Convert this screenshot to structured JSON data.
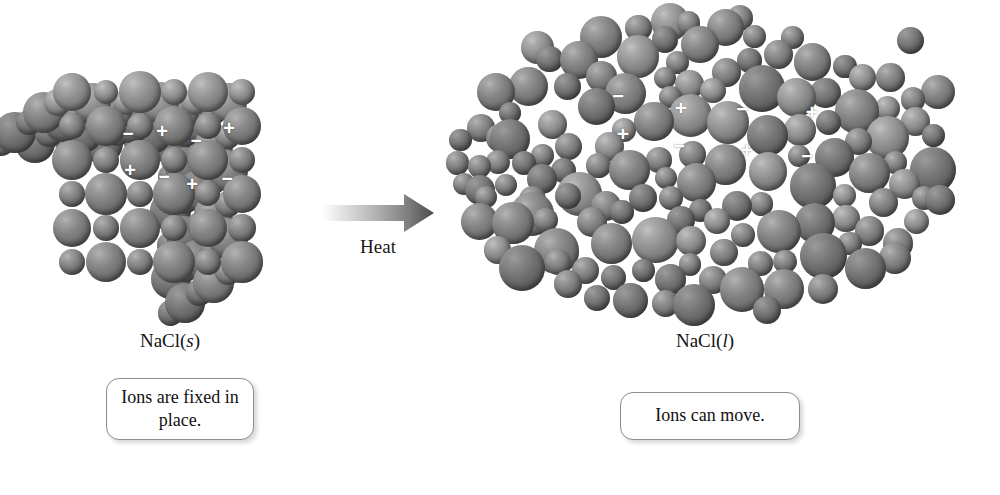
{
  "figure": {
    "type": "diagram",
    "topic": "Melting of sodium chloride: ionic solid to ionic liquid",
    "background_color": "#ffffff",
    "sphere_color": "#7a7a7a",
    "charge_label_color": "#ffffff"
  },
  "solid": {
    "state_label_main": "NaCl(",
    "state_label_italic": "s",
    "state_label_close": ")",
    "caption": "Ions are fixed in place.",
    "description": "Ordered cubic crystal lattice of alternating positive and negative ions",
    "charges": [
      {
        "sign": "−",
        "x": 128,
        "y": 133,
        "size": 19
      },
      {
        "sign": "+",
        "x": 162,
        "y": 131,
        "size": 20
      },
      {
        "sign": "−",
        "x": 196,
        "y": 140,
        "size": 19
      },
      {
        "sign": "+",
        "x": 229,
        "y": 128,
        "size": 20
      },
      {
        "sign": "+",
        "x": 130,
        "y": 170,
        "size": 20
      },
      {
        "sign": "−",
        "x": 164,
        "y": 176,
        "size": 19
      },
      {
        "sign": "+",
        "x": 192,
        "y": 184,
        "size": 20
      },
      {
        "sign": "−",
        "x": 227,
        "y": 178,
        "size": 19
      }
    ]
  },
  "arrow": {
    "label": "Heat",
    "gradient_from": "#ffffff",
    "gradient_to": "#4a4a4a",
    "direction": "left-to-right"
  },
  "liquid": {
    "state_label_main": "NaCl(",
    "state_label_italic": "l",
    "state_label_close": ")",
    "caption": "Ions can move.",
    "description": "Disordered cluster of mobile positive and negative ions",
    "charges": [
      {
        "sign": "−",
        "x": 618,
        "y": 96,
        "size": 20
      },
      {
        "sign": "+",
        "x": 681,
        "y": 107,
        "size": 21
      },
      {
        "sign": "−",
        "x": 742,
        "y": 109,
        "size": 20
      },
      {
        "sign": "+",
        "x": 812,
        "y": 111,
        "size": 21
      },
      {
        "sign": "+",
        "x": 623,
        "y": 133,
        "size": 21
      },
      {
        "sign": "−",
        "x": 679,
        "y": 146,
        "size": 20
      },
      {
        "sign": "+",
        "x": 747,
        "y": 149,
        "size": 21
      },
      {
        "sign": "−",
        "x": 807,
        "y": 156,
        "size": 20
      }
    ]
  }
}
